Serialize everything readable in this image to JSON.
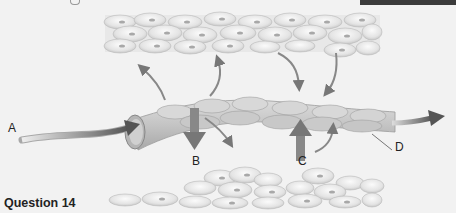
{
  "figure": {
    "labels": {
      "a": "A",
      "b": "B",
      "c": "C",
      "d": "D"
    }
  },
  "question": {
    "title": "Question 14"
  },
  "colors": {
    "arrow": "#6a6a6a",
    "background": "#f2f2f2",
    "header_bar": "#3b3b3b"
  }
}
